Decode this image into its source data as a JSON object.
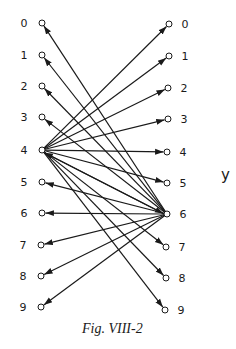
{
  "figure": {
    "caption": "Fig. VIII-2",
    "right_set_label": "y",
    "colors": {
      "ink": "#1a1a1a",
      "background": "#ffffff"
    },
    "left_nodes": [
      {
        "label": "0",
        "x": 42,
        "y": 23
      },
      {
        "label": "1",
        "x": 42,
        "y": 55
      },
      {
        "label": "2",
        "x": 42,
        "y": 86
      },
      {
        "label": "3",
        "x": 42,
        "y": 117
      },
      {
        "label": "4",
        "x": 42,
        "y": 150
      },
      {
        "label": "5",
        "x": 42,
        "y": 182
      },
      {
        "label": "6",
        "x": 42,
        "y": 213
      },
      {
        "label": "7",
        "x": 41,
        "y": 245
      },
      {
        "label": "8",
        "x": 41,
        "y": 276
      },
      {
        "label": "9",
        "x": 41,
        "y": 307
      }
    ],
    "right_nodes": [
      {
        "label": "0",
        "x": 169,
        "y": 24
      },
      {
        "label": "1",
        "x": 169,
        "y": 56
      },
      {
        "label": "2",
        "x": 168,
        "y": 88
      },
      {
        "label": "3",
        "x": 168,
        "y": 119
      },
      {
        "label": "4",
        "x": 167,
        "y": 152
      },
      {
        "label": "5",
        "x": 167,
        "y": 183
      },
      {
        "label": "6",
        "x": 167,
        "y": 214
      },
      {
        "label": "7",
        "x": 166,
        "y": 247
      },
      {
        "label": "8",
        "x": 166,
        "y": 278
      },
      {
        "label": "9",
        "x": 165,
        "y": 310
      }
    ],
    "edges": [
      {
        "from": "L4",
        "to": "R0"
      },
      {
        "from": "L4",
        "to": "R1"
      },
      {
        "from": "L4",
        "to": "R2"
      },
      {
        "from": "L4",
        "to": "R3"
      },
      {
        "from": "L4",
        "to": "R4"
      },
      {
        "from": "L4",
        "to": "R5"
      },
      {
        "from": "L4",
        "to": "R6"
      },
      {
        "from": "L4",
        "to": "R7"
      },
      {
        "from": "L4",
        "to": "R8"
      },
      {
        "from": "L4",
        "to": "R9"
      },
      {
        "from": "R6",
        "to": "L0"
      },
      {
        "from": "R6",
        "to": "L1"
      },
      {
        "from": "R6",
        "to": "L2"
      },
      {
        "from": "R6",
        "to": "L3"
      },
      {
        "from": "R6",
        "to": "L4"
      },
      {
        "from": "R6",
        "to": "L5"
      },
      {
        "from": "R6",
        "to": "L6"
      },
      {
        "from": "R6",
        "to": "L7"
      },
      {
        "from": "R6",
        "to": "L8"
      },
      {
        "from": "R6",
        "to": "L9"
      }
    ]
  }
}
